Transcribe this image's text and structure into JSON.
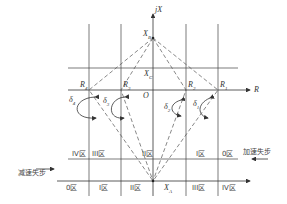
{
  "axes": {
    "x_axis_label": "jX",
    "r_axis_label": "R",
    "origin_label": "O"
  },
  "points": {
    "xb": "X_B",
    "xc": "X_C",
    "xa": "X_A",
    "r1": "R_1",
    "r2": "R_2",
    "r3": "R_3",
    "r4": "R_4"
  },
  "point_labels": {
    "xb_main": "X",
    "xb_sub": "B",
    "xc_main": "X",
    "xc_sub": "C",
    "xa_main": "X",
    "xa_sub": "A",
    "r1_main": "R",
    "r1_sub": "1",
    "r2_main": "R",
    "r2_sub": "2",
    "r3_main": "R",
    "r3_sub": "3",
    "r4_main": "R",
    "r4_sub": "4"
  },
  "angles": {
    "d1_main": "δ",
    "d1_sub": "1",
    "d2_main": "δ",
    "d2_sub": "2",
    "d3_main": "δ",
    "d3_sub": "3",
    "d4_main": "δ",
    "d4_sub": "4"
  },
  "zones_upper_row": [
    "IV区",
    "III区",
    "II区",
    "I区",
    "0区"
  ],
  "zones_lower_row": [
    "0区",
    "I区",
    "II区",
    "III区",
    "IV区"
  ],
  "arrows": {
    "accelerating": "加速失步",
    "decelerating": "减速失步"
  }
}
